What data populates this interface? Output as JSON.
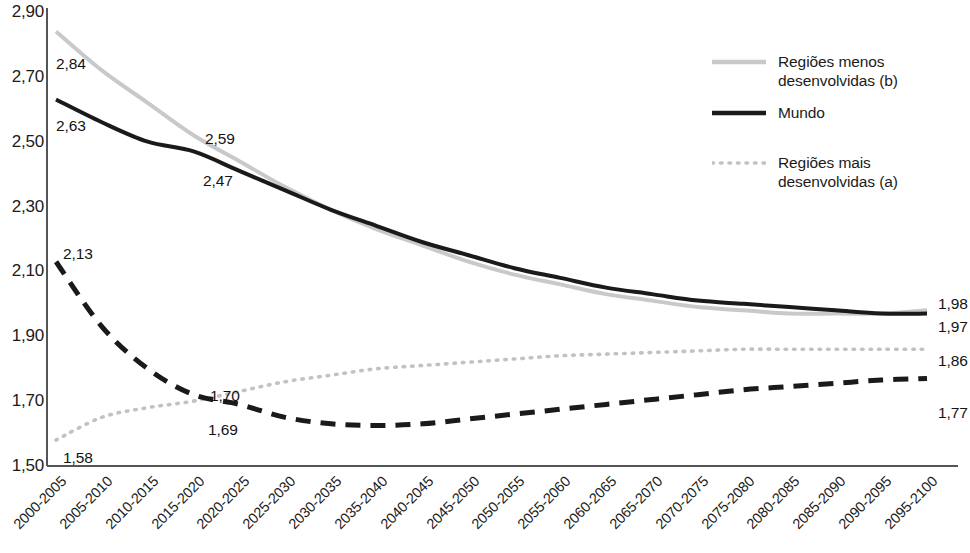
{
  "chart_data": {
    "type": "line",
    "title": "",
    "xlabel": "",
    "ylabel": "",
    "ylim": [
      1.5,
      2.9
    ],
    "ytick_labels": [
      "2,90",
      "2,70",
      "2,50",
      "2,30",
      "2,10",
      "1,90",
      "1,70",
      "1,50"
    ],
    "ytick_values": [
      2.9,
      2.7,
      2.5,
      2.3,
      2.1,
      1.9,
      1.7,
      1.5
    ],
    "grid": false,
    "legend_position": "top-right",
    "categories": [
      "2000-2005",
      "2005-2010",
      "2010-2015",
      "2015-2020",
      "2020-2025",
      "2025-2030",
      "2030-2035",
      "2035-2040",
      "2040-2045",
      "2045-2050",
      "2050-2055",
      "2055-2060",
      "2060-2065",
      "2065-2070",
      "2070-2075",
      "2075-2080",
      "2080-2085",
      "2085-2090",
      "2090-2095",
      "2095-2100"
    ],
    "series": [
      {
        "name": "Regiões menos desenvolvidas (b)",
        "style": "solid",
        "color": "#c9c9c9",
        "values": [
          2.84,
          2.72,
          2.62,
          2.52,
          2.44,
          2.36,
          2.29,
          2.23,
          2.18,
          2.13,
          2.09,
          2.06,
          2.03,
          2.01,
          1.99,
          1.98,
          1.97,
          1.97,
          1.97,
          1.98
        ]
      },
      {
        "name": "Mundo",
        "style": "solid",
        "color": "#1a1a1a",
        "values": [
          2.63,
          2.56,
          2.5,
          2.47,
          2.41,
          2.35,
          2.29,
          2.24,
          2.19,
          2.15,
          2.11,
          2.08,
          2.05,
          2.03,
          2.01,
          2.0,
          1.99,
          1.98,
          1.97,
          1.97
        ]
      },
      {
        "name": "Regiões mais desenvolvidas (a)",
        "style": "dotted",
        "color": "#c2c2c2",
        "values": [
          1.58,
          1.65,
          1.68,
          1.7,
          1.73,
          1.76,
          1.78,
          1.8,
          1.81,
          1.82,
          1.83,
          1.84,
          1.845,
          1.85,
          1.855,
          1.86,
          1.86,
          1.86,
          1.86,
          1.86
        ]
      },
      {
        "name": "",
        "style": "dashed",
        "color": "#1a1a1a",
        "values": [
          2.13,
          1.93,
          1.8,
          1.72,
          1.69,
          1.65,
          1.63,
          1.625,
          1.63,
          1.645,
          1.66,
          1.675,
          1.69,
          1.705,
          1.72,
          1.735,
          1.745,
          1.755,
          1.765,
          1.77
        ]
      }
    ],
    "point_labels": [
      {
        "text": "2,84",
        "x": 56,
        "y": 55
      },
      {
        "text": "2,63",
        "x": 56,
        "y": 117
      },
      {
        "text": "2,59",
        "x": 205,
        "y": 130
      },
      {
        "text": "2,47",
        "x": 203,
        "y": 172
      },
      {
        "text": "2,13",
        "x": 63,
        "y": 245
      },
      {
        "text": "1,70",
        "x": 210,
        "y": 387
      },
      {
        "text": "1,69",
        "x": 208,
        "y": 421
      },
      {
        "text": "1,58",
        "x": 63,
        "y": 449
      },
      {
        "text": "1,98",
        "x": 938,
        "y": 295
      },
      {
        "text": "1,97",
        "x": 938,
        "y": 318
      },
      {
        "text": "1,86",
        "x": 938,
        "y": 352
      },
      {
        "text": "1,77",
        "x": 938,
        "y": 404
      }
    ],
    "legend": [
      {
        "label": "Regiões menos\ndesenvolvidas (b)",
        "style": "solid",
        "color": "#c9c9c9",
        "swatch_y": 62,
        "text_y": 52
      },
      {
        "label": "Mundo",
        "style": "solid",
        "color": "#1a1a1a",
        "swatch_y": 113,
        "text_y": 103
      },
      {
        "label": "Regiões mais\ndesenvolvidas (a)",
        "style": "dotted",
        "color": "#c2c2c2",
        "swatch_y": 163,
        "text_y": 153
      }
    ]
  }
}
